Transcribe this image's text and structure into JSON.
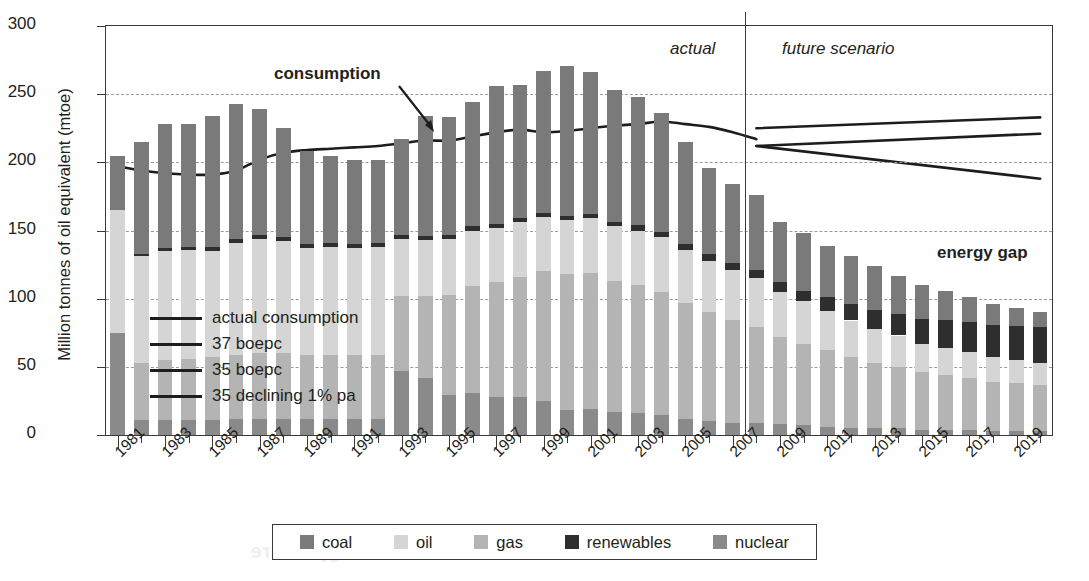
{
  "chart_data": {
    "type": "bar",
    "title": "",
    "xlabel": "",
    "ylabel": "Million tonnes of oil equivalent (mtoe)",
    "ylim": [
      0,
      300
    ],
    "yticks": [
      0,
      50,
      100,
      150,
      200,
      250,
      300
    ],
    "grid": true,
    "legend_position": "bottom",
    "x": [
      1981,
      1982,
      1983,
      1984,
      1985,
      1986,
      1987,
      1988,
      1989,
      1990,
      1991,
      1992,
      1993,
      1994,
      1995,
      1996,
      1997,
      1998,
      1999,
      2000,
      2001,
      2002,
      2003,
      2004,
      2005,
      2006,
      2007,
      2008,
      2009,
      2010,
      2011,
      2012,
      2013,
      2014,
      2015,
      2016,
      2017,
      2018,
      2019,
      2020
    ],
    "xtick_labels": [
      "1981",
      "1983",
      "1985",
      "1987",
      "1989",
      "1991",
      "1993",
      "1995",
      "1997",
      "1999",
      "2001",
      "2003",
      "2005",
      "2007",
      "2009",
      "2011",
      "2013",
      "2015",
      "2017",
      "2019"
    ],
    "series": [
      {
        "name": "nuclear",
        "color": "#8a8a8a",
        "values": [
          75,
          11,
          11,
          11,
          11,
          12,
          12,
          12,
          12,
          12,
          12,
          12,
          47,
          42,
          29,
          31,
          28,
          28,
          25,
          18,
          19,
          17,
          16,
          15,
          12,
          10,
          9,
          9,
          8,
          7,
          6,
          5,
          5,
          5,
          4,
          4,
          4,
          3,
          3,
          3
        ]
      },
      {
        "name": "gas",
        "color": "#b4b4b4",
        "values": [
          0,
          42,
          44,
          45,
          46,
          47,
          48,
          48,
          47,
          47,
          47,
          47,
          55,
          60,
          74,
          78,
          84,
          88,
          95,
          100,
          100,
          96,
          94,
          90,
          85,
          80,
          75,
          70,
          64,
          60,
          56,
          52,
          48,
          45,
          42,
          40,
          38,
          36,
          35,
          34
        ]
      },
      {
        "name": "oil",
        "color": "#d5d5d5",
        "values": [
          90,
          78,
          80,
          80,
          78,
          82,
          84,
          82,
          78,
          79,
          78,
          79,
          42,
          41,
          41,
          41,
          40,
          40,
          40,
          40,
          40,
          40,
          40,
          40,
          39,
          38,
          37,
          36,
          33,
          31,
          29,
          27,
          25,
          23,
          21,
          20,
          19,
          18,
          17,
          16
        ]
      },
      {
        "name": "renewables",
        "color": "#2e2e2e",
        "values": [
          0,
          2,
          2,
          2,
          3,
          3,
          3,
          3,
          3,
          3,
          3,
          3,
          3,
          3,
          3,
          3,
          3,
          3,
          3,
          3,
          3,
          3,
          4,
          4,
          4,
          5,
          5,
          6,
          7,
          8,
          10,
          12,
          14,
          16,
          18,
          20,
          22,
          24,
          25,
          26
        ]
      },
      {
        "name": "coal",
        "color": "#7a7a7a",
        "values": [
          40,
          82,
          91,
          90,
          96,
          99,
          92,
          80,
          68,
          64,
          62,
          61,
          70,
          88,
          86,
          91,
          101,
          98,
          104,
          110,
          104,
          97,
          94,
          87,
          75,
          63,
          58,
          55,
          44,
          42,
          38,
          35,
          32,
          28,
          25,
          22,
          18,
          15,
          13,
          11
        ]
      }
    ],
    "lines": [
      {
        "name": "actual consumption",
        "segment": "actual",
        "x": [
          1981,
          1982,
          1983,
          1984,
          1985,
          1986,
          1987,
          1988,
          1989,
          1990,
          1991,
          1992,
          1993,
          1994,
          1995,
          1996,
          1997,
          1998,
          1999,
          2000,
          2001,
          2002,
          2003,
          2004,
          2005,
          2006,
          2007,
          2008
        ],
        "y": [
          197,
          194,
          192,
          191,
          191,
          194,
          202,
          207,
          209,
          210,
          211,
          212,
          214,
          216,
          216,
          219,
          222,
          224,
          222,
          223,
          225,
          227,
          228,
          230,
          228,
          226,
          222,
          217
        ]
      },
      {
        "name": "37 boepc",
        "segment": "future",
        "x": [
          2008,
          2020
        ],
        "y": [
          225,
          233
        ]
      },
      {
        "name": "35 boepc",
        "segment": "future",
        "x": [
          2008,
          2020
        ],
        "y": [
          212,
          221
        ]
      },
      {
        "name": "35 declining 1% pa",
        "segment": "future",
        "x": [
          2008,
          2020
        ],
        "y": [
          212,
          188
        ]
      }
    ],
    "annotations": [
      {
        "text": "consumption",
        "style": "bold"
      },
      {
        "text": "actual",
        "style": "italic"
      },
      {
        "text": "future scenario",
        "style": "italic"
      },
      {
        "text": "energy gap",
        "style": "bold"
      }
    ],
    "divider_year": 2008
  },
  "axis": {
    "y_title": "Million tonnes of oil equivalent (mtoe)",
    "y_ticks": [
      "300",
      "250",
      "200",
      "150",
      "100",
      "50",
      "0"
    ],
    "x_labels": [
      "1981",
      "1983",
      "1985",
      "1987",
      "1989",
      "1991",
      "1993",
      "1995",
      "1997",
      "1999",
      "2001",
      "2003",
      "2005",
      "2007",
      "2009",
      "2011",
      "2013",
      "2015",
      "2017",
      "2019"
    ]
  },
  "annotations": {
    "consumption": "consumption",
    "actual": "actual",
    "future_scenario": "future scenario",
    "energy_gap": "energy gap"
  },
  "inner_legend": {
    "items": [
      {
        "label": "actual consumption"
      },
      {
        "label": "37 boepc"
      },
      {
        "label": "35 boepc"
      },
      {
        "label": "35 declining 1% pa"
      }
    ]
  },
  "bottom_legend": {
    "items": [
      {
        "label": "coal",
        "color": "#7a7a7a"
      },
      {
        "label": "oil",
        "color": "#d5d5d5"
      },
      {
        "label": "gas",
        "color": "#b4b4b4"
      },
      {
        "label": "renewables",
        "color": "#2e2e2e"
      },
      {
        "label": "nuclear",
        "color": "#8a8a8a"
      }
    ]
  },
  "watermark": {
    "line1": "Thinking like",
    "line2": "a geographer",
    "line3": "Resources",
    "line4": "scenario",
    "line5": "energy future"
  }
}
